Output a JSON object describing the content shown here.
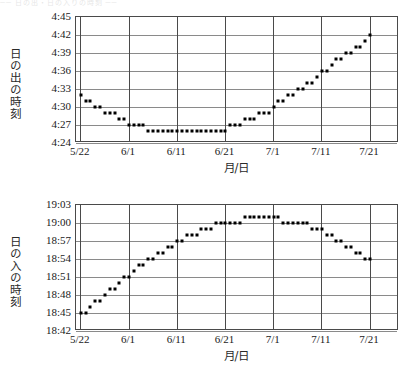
{
  "page": {
    "ghost_text": "── 日の出・日の入りの時刻 ──"
  },
  "charts": [
    {
      "id": "sunrise",
      "name": "sunrise-chart",
      "ylabel": "日の出の時刻",
      "xlabel": "月/日",
      "y_ticks": [
        "4:45",
        "4:42",
        "4:39",
        "4:36",
        "4:33",
        "4:30",
        "4:27",
        "4:24"
      ],
      "x_ticks": [
        "5/22",
        "6/1",
        "6/11",
        "6/21",
        "7/1",
        "7/11",
        "7/21"
      ]
    },
    {
      "id": "sunset",
      "name": "sunset-chart",
      "ylabel": "日の入の時刻",
      "xlabel": "月/日",
      "y_ticks": [
        "19:03",
        "19:00",
        "18:57",
        "18:54",
        "18:51",
        "18:48",
        "18:45",
        "18:42"
      ],
      "x_ticks": [
        "5/22",
        "6/1",
        "6/11",
        "6/21",
        "7/1",
        "7/11",
        "7/21"
      ]
    }
  ],
  "chart_data": [
    {
      "type": "scatter",
      "id": "sunrise",
      "title": "",
      "ylabel": "日の出の時刻",
      "xlabel": "月/日",
      "ylim_minutes": [
        264,
        285
      ],
      "ylim": [
        "4:24",
        "4:45"
      ],
      "y_tick_labels": [
        "4:45",
        "4:42",
        "4:39",
        "4:36",
        "4:33",
        "4:30",
        "4:27",
        "4:24"
      ],
      "y_tick_minutes": [
        285,
        282,
        279,
        276,
        273,
        270,
        267,
        264
      ],
      "x_tick_labels": [
        "5/22",
        "6/1",
        "6/11",
        "6/21",
        "7/1",
        "7/11",
        "7/21"
      ],
      "x_tick_days": [
        0,
        10,
        20,
        30,
        40,
        50,
        60
      ],
      "xlim_days": [
        -1,
        66
      ],
      "grid": true,
      "legend": "none",
      "marker": "square",
      "marker_color": "#000000",
      "x_start_date": "5/22",
      "points": [
        {
          "day": 0,
          "date": "5/22",
          "time": "4:32",
          "minutes": 272
        },
        {
          "day": 1,
          "date": "5/23",
          "time": "4:31",
          "minutes": 271
        },
        {
          "day": 2,
          "date": "5/24",
          "time": "4:31",
          "minutes": 271
        },
        {
          "day": 3,
          "date": "5/25",
          "time": "4:30",
          "minutes": 270
        },
        {
          "day": 4,
          "date": "5/26",
          "time": "4:30",
          "minutes": 270
        },
        {
          "day": 5,
          "date": "5/27",
          "time": "4:29",
          "minutes": 269
        },
        {
          "day": 6,
          "date": "5/28",
          "time": "4:29",
          "minutes": 269
        },
        {
          "day": 7,
          "date": "5/29",
          "time": "4:29",
          "minutes": 269
        },
        {
          "day": 8,
          "date": "5/30",
          "time": "4:28",
          "minutes": 268
        },
        {
          "day": 9,
          "date": "5/31",
          "time": "4:28",
          "minutes": 268
        },
        {
          "day": 10,
          "date": "6/1",
          "time": "4:27",
          "minutes": 267
        },
        {
          "day": 11,
          "date": "6/2",
          "time": "4:27",
          "minutes": 267
        },
        {
          "day": 12,
          "date": "6/3",
          "time": "4:27",
          "minutes": 267
        },
        {
          "day": 13,
          "date": "6/4",
          "time": "4:27",
          "minutes": 267
        },
        {
          "day": 14,
          "date": "6/5",
          "time": "4:26",
          "minutes": 266
        },
        {
          "day": 15,
          "date": "6/6",
          "time": "4:26",
          "minutes": 266
        },
        {
          "day": 16,
          "date": "6/7",
          "time": "4:26",
          "minutes": 266
        },
        {
          "day": 17,
          "date": "6/8",
          "time": "4:26",
          "minutes": 266
        },
        {
          "day": 18,
          "date": "6/9",
          "time": "4:26",
          "minutes": 266
        },
        {
          "day": 19,
          "date": "6/10",
          "time": "4:26",
          "minutes": 266
        },
        {
          "day": 20,
          "date": "6/11",
          "time": "4:26",
          "minutes": 266
        },
        {
          "day": 21,
          "date": "6/12",
          "time": "4:26",
          "minutes": 266
        },
        {
          "day": 22,
          "date": "6/13",
          "time": "4:26",
          "minutes": 266
        },
        {
          "day": 23,
          "date": "6/14",
          "time": "4:26",
          "minutes": 266
        },
        {
          "day": 24,
          "date": "6/15",
          "time": "4:26",
          "minutes": 266
        },
        {
          "day": 25,
          "date": "6/16",
          "time": "4:26",
          "minutes": 266
        },
        {
          "day": 26,
          "date": "6/17",
          "time": "4:26",
          "minutes": 266
        },
        {
          "day": 27,
          "date": "6/18",
          "time": "4:26",
          "minutes": 266
        },
        {
          "day": 28,
          "date": "6/19",
          "time": "4:26",
          "minutes": 266
        },
        {
          "day": 29,
          "date": "6/20",
          "time": "4:26",
          "minutes": 266
        },
        {
          "day": 30,
          "date": "6/21",
          "time": "4:26",
          "minutes": 266
        },
        {
          "day": 31,
          "date": "6/22",
          "time": "4:27",
          "minutes": 267
        },
        {
          "day": 32,
          "date": "6/23",
          "time": "4:27",
          "minutes": 267
        },
        {
          "day": 33,
          "date": "6/24",
          "time": "4:27",
          "minutes": 267
        },
        {
          "day": 34,
          "date": "6/25",
          "time": "4:28",
          "minutes": 268
        },
        {
          "day": 35,
          "date": "6/26",
          "time": "4:28",
          "minutes": 268
        },
        {
          "day": 36,
          "date": "6/27",
          "time": "4:28",
          "minutes": 268
        },
        {
          "day": 37,
          "date": "6/28",
          "time": "4:29",
          "minutes": 269
        },
        {
          "day": 38,
          "date": "6/29",
          "time": "4:29",
          "minutes": 269
        },
        {
          "day": 39,
          "date": "6/30",
          "time": "4:29",
          "minutes": 269
        },
        {
          "day": 40,
          "date": "7/1",
          "time": "4:30",
          "minutes": 270
        },
        {
          "day": 41,
          "date": "7/2",
          "time": "4:31",
          "minutes": 271
        },
        {
          "day": 42,
          "date": "7/3",
          "time": "4:31",
          "minutes": 271
        },
        {
          "day": 43,
          "date": "7/4",
          "time": "4:32",
          "minutes": 272
        },
        {
          "day": 44,
          "date": "7/5",
          "time": "4:32",
          "minutes": 272
        },
        {
          "day": 45,
          "date": "7/6",
          "time": "4:33",
          "minutes": 273
        },
        {
          "day": 46,
          "date": "7/7",
          "time": "4:33",
          "minutes": 273
        },
        {
          "day": 47,
          "date": "7/8",
          "time": "4:34",
          "minutes": 274
        },
        {
          "day": 48,
          "date": "7/9",
          "time": "4:34",
          "minutes": 274
        },
        {
          "day": 49,
          "date": "7/10",
          "time": "4:35",
          "minutes": 275
        },
        {
          "day": 50,
          "date": "7/11",
          "time": "4:36",
          "minutes": 276
        },
        {
          "day": 51,
          "date": "7/12",
          "time": "4:36",
          "minutes": 276
        },
        {
          "day": 52,
          "date": "7/13",
          "time": "4:37",
          "minutes": 277
        },
        {
          "day": 53,
          "date": "7/14",
          "time": "4:38",
          "minutes": 278
        },
        {
          "day": 54,
          "date": "7/15",
          "time": "4:38",
          "minutes": 278
        },
        {
          "day": 55,
          "date": "7/16",
          "time": "4:39",
          "minutes": 279
        },
        {
          "day": 56,
          "date": "7/17",
          "time": "4:39",
          "minutes": 279
        },
        {
          "day": 57,
          "date": "7/18",
          "time": "4:40",
          "minutes": 280
        },
        {
          "day": 58,
          "date": "7/19",
          "time": "4:40",
          "minutes": 280
        },
        {
          "day": 59,
          "date": "7/20",
          "time": "4:41",
          "minutes": 281
        },
        {
          "day": 60,
          "date": "7/21",
          "time": "4:42",
          "minutes": 282
        }
      ]
    },
    {
      "type": "scatter",
      "id": "sunset",
      "title": "",
      "ylabel": "日の入の時刻",
      "xlabel": "月/日",
      "ylim_minutes": [
        1122,
        1143
      ],
      "ylim": [
        "18:42",
        "19:03"
      ],
      "y_tick_labels": [
        "19:03",
        "19:00",
        "18:57",
        "18:54",
        "18:51",
        "18:48",
        "18:45",
        "18:42"
      ],
      "y_tick_minutes": [
        1143,
        1140,
        1137,
        1134,
        1131,
        1128,
        1125,
        1122
      ],
      "x_tick_labels": [
        "5/22",
        "6/1",
        "6/11",
        "6/21",
        "7/1",
        "7/11",
        "7/21"
      ],
      "x_tick_days": [
        0,
        10,
        20,
        30,
        40,
        50,
        60
      ],
      "xlim_days": [
        -1,
        66
      ],
      "grid": true,
      "legend": "none",
      "marker": "square",
      "marker_color": "#000000",
      "x_start_date": "5/22",
      "points": [
        {
          "day": 0,
          "date": "5/22",
          "time": "18:45",
          "minutes": 1125
        },
        {
          "day": 1,
          "date": "5/23",
          "time": "18:45",
          "minutes": 1125
        },
        {
          "day": 2,
          "date": "5/24",
          "time": "18:46",
          "minutes": 1126
        },
        {
          "day": 3,
          "date": "5/25",
          "time": "18:47",
          "minutes": 1127
        },
        {
          "day": 4,
          "date": "5/26",
          "time": "18:47",
          "minutes": 1127
        },
        {
          "day": 5,
          "date": "5/27",
          "time": "18:48",
          "minutes": 1128
        },
        {
          "day": 6,
          "date": "5/28",
          "time": "18:49",
          "minutes": 1129
        },
        {
          "day": 7,
          "date": "5/29",
          "time": "18:49",
          "minutes": 1129
        },
        {
          "day": 8,
          "date": "5/30",
          "time": "18:50",
          "minutes": 1130
        },
        {
          "day": 9,
          "date": "5/31",
          "time": "18:51",
          "minutes": 1131
        },
        {
          "day": 10,
          "date": "6/1",
          "time": "18:51",
          "minutes": 1131
        },
        {
          "day": 11,
          "date": "6/2",
          "time": "18:52",
          "minutes": 1132
        },
        {
          "day": 12,
          "date": "6/3",
          "time": "18:53",
          "minutes": 1133
        },
        {
          "day": 13,
          "date": "6/4",
          "time": "18:53",
          "minutes": 1133
        },
        {
          "day": 14,
          "date": "6/5",
          "time": "18:54",
          "minutes": 1134
        },
        {
          "day": 15,
          "date": "6/6",
          "time": "18:54",
          "minutes": 1134
        },
        {
          "day": 16,
          "date": "6/7",
          "time": "18:55",
          "minutes": 1135
        },
        {
          "day": 17,
          "date": "6/8",
          "time": "18:55",
          "minutes": 1135
        },
        {
          "day": 18,
          "date": "6/9",
          "time": "18:56",
          "minutes": 1136
        },
        {
          "day": 19,
          "date": "6/10",
          "time": "18:56",
          "minutes": 1136
        },
        {
          "day": 20,
          "date": "6/11",
          "time": "18:57",
          "minutes": 1137
        },
        {
          "day": 21,
          "date": "6/12",
          "time": "18:57",
          "minutes": 1137
        },
        {
          "day": 22,
          "date": "6/13",
          "time": "18:58",
          "minutes": 1138
        },
        {
          "day": 23,
          "date": "6/14",
          "time": "18:58",
          "minutes": 1138
        },
        {
          "day": 24,
          "date": "6/15",
          "time": "18:58",
          "minutes": 1138
        },
        {
          "day": 25,
          "date": "6/16",
          "time": "18:59",
          "minutes": 1139
        },
        {
          "day": 26,
          "date": "6/17",
          "time": "18:59",
          "minutes": 1139
        },
        {
          "day": 27,
          "date": "6/18",
          "time": "18:59",
          "minutes": 1139
        },
        {
          "day": 28,
          "date": "6/19",
          "time": "19:00",
          "minutes": 1140
        },
        {
          "day": 29,
          "date": "6/20",
          "time": "19:00",
          "minutes": 1140
        },
        {
          "day": 30,
          "date": "6/21",
          "time": "19:00",
          "minutes": 1140
        },
        {
          "day": 31,
          "date": "6/22",
          "time": "19:00",
          "minutes": 1140
        },
        {
          "day": 32,
          "date": "6/23",
          "time": "19:00",
          "minutes": 1140
        },
        {
          "day": 33,
          "date": "6/24",
          "time": "19:00",
          "minutes": 1140
        },
        {
          "day": 34,
          "date": "6/25",
          "time": "19:01",
          "minutes": 1141
        },
        {
          "day": 35,
          "date": "6/26",
          "time": "19:01",
          "minutes": 1141
        },
        {
          "day": 36,
          "date": "6/27",
          "time": "19:01",
          "minutes": 1141
        },
        {
          "day": 37,
          "date": "6/28",
          "time": "19:01",
          "minutes": 1141
        },
        {
          "day": 38,
          "date": "6/29",
          "time": "19:01",
          "minutes": 1141
        },
        {
          "day": 39,
          "date": "6/30",
          "time": "19:01",
          "minutes": 1141
        },
        {
          "day": 40,
          "date": "7/1",
          "time": "19:01",
          "minutes": 1141
        },
        {
          "day": 41,
          "date": "7/2",
          "time": "19:01",
          "minutes": 1141
        },
        {
          "day": 42,
          "date": "7/3",
          "time": "19:00",
          "minutes": 1140
        },
        {
          "day": 43,
          "date": "7/4",
          "time": "19:00",
          "minutes": 1140
        },
        {
          "day": 44,
          "date": "7/5",
          "time": "19:00",
          "minutes": 1140
        },
        {
          "day": 45,
          "date": "7/6",
          "time": "19:00",
          "minutes": 1140
        },
        {
          "day": 46,
          "date": "7/7",
          "time": "19:00",
          "minutes": 1140
        },
        {
          "day": 47,
          "date": "7/8",
          "time": "19:00",
          "minutes": 1140
        },
        {
          "day": 48,
          "date": "7/9",
          "time": "18:59",
          "minutes": 1139
        },
        {
          "day": 49,
          "date": "7/10",
          "time": "18:59",
          "minutes": 1139
        },
        {
          "day": 50,
          "date": "7/11",
          "time": "18:59",
          "minutes": 1139
        },
        {
          "day": 51,
          "date": "7/12",
          "time": "18:58",
          "minutes": 1138
        },
        {
          "day": 52,
          "date": "7/13",
          "time": "18:58",
          "minutes": 1138
        },
        {
          "day": 53,
          "date": "7/14",
          "time": "18:57",
          "minutes": 1137
        },
        {
          "day": 54,
          "date": "7/15",
          "time": "18:57",
          "minutes": 1137
        },
        {
          "day": 55,
          "date": "7/16",
          "time": "18:56",
          "minutes": 1136
        },
        {
          "day": 56,
          "date": "7/17",
          "time": "18:56",
          "minutes": 1136
        },
        {
          "day": 57,
          "date": "7/18",
          "time": "18:55",
          "minutes": 1135
        },
        {
          "day": 58,
          "date": "7/19",
          "time": "18:55",
          "minutes": 1135
        },
        {
          "day": 59,
          "date": "7/20",
          "time": "18:54",
          "minutes": 1134
        },
        {
          "day": 60,
          "date": "7/21",
          "time": "18:54",
          "minutes": 1134
        }
      ]
    }
  ]
}
